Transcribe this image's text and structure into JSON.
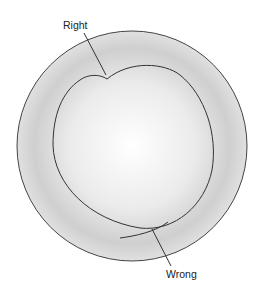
{
  "labels": {
    "right": "Right",
    "wrong": "Wrong"
  },
  "colors": {
    "background": "#ffffff",
    "disc_center": "#ffffff",
    "disc_edge": "#c8c8c8",
    "line": "#333333"
  }
}
